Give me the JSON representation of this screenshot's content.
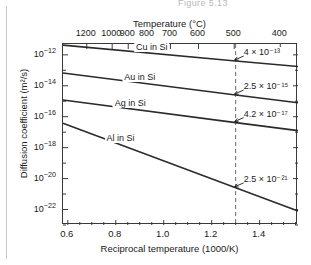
{
  "page": {
    "header_fragment": "Figure 5.13"
  },
  "chart_data": {
    "type": "line",
    "title": "",
    "xlabel": "Reciprocal temperature (1000/K)",
    "ylabel": "Diffusion coefficient (m²/s)",
    "top_axis_label": "Temperature (°C)",
    "xlim": [
      0.58,
      1.56
    ],
    "ylim_log10": [
      -23.0,
      -11.3
    ],
    "grid": false,
    "legend": "inline-labels",
    "xticks": [
      "0.6",
      "0.8",
      "1.0",
      "1.2",
      "1.4"
    ],
    "xtick_values": [
      0.6,
      0.8,
      1.0,
      1.2,
      1.4
    ],
    "yticks": [
      {
        "mantissa": "10",
        "exponent": "−12",
        "log10": -12
      },
      {
        "mantissa": "10",
        "exponent": "−14",
        "log10": -14
      },
      {
        "mantissa": "10",
        "exponent": "−16",
        "log10": -16
      },
      {
        "mantissa": "10",
        "exponent": "−18",
        "log10": -18
      },
      {
        "mantissa": "10",
        "exponent": "−20",
        "log10": -20
      },
      {
        "mantissa": "10",
        "exponent": "−22",
        "log10": -22
      }
    ],
    "top_ticks": [
      {
        "label": "1200",
        "celsius": 1200,
        "x": 0.679
      },
      {
        "label": "1000",
        "celsius": 1000,
        "x": 0.785
      },
      {
        "label": "900",
        "celsius": 900,
        "x": 0.852
      },
      {
        "label": "800",
        "celsius": 800,
        "x": 0.932
      },
      {
        "label": "700",
        "celsius": 700,
        "x": 1.028
      },
      {
        "label": "600",
        "celsius": 600,
        "x": 1.145
      },
      {
        "label": "500",
        "celsius": 500,
        "x": 1.294
      },
      {
        "label": "400",
        "celsius": 400,
        "x": 1.486
      }
    ],
    "marker_line": {
      "x": 1.3,
      "style": "dashed",
      "label": "500 °C reference"
    },
    "series": [
      {
        "name": "Cu in Si",
        "label": "Cu in Si",
        "points": [
          [
            0.58,
            -11.37
          ],
          [
            1.3,
            -12.4
          ],
          [
            1.56,
            -12.75
          ]
        ],
        "value_at_marker": "4 × 10⁻¹³"
      },
      {
        "name": "Au in Si",
        "label": "Au in Si",
        "points": [
          [
            0.58,
            -13.18
          ],
          [
            1.3,
            -14.6
          ],
          [
            1.56,
            -15.1
          ]
        ],
        "value_at_marker": "2.5 × 10⁻¹⁵"
      },
      {
        "name": "Ag in Si",
        "label": "Ag in Si",
        "points": [
          [
            0.58,
            -14.92
          ],
          [
            1.3,
            -16.38
          ],
          [
            1.56,
            -16.9
          ]
        ],
        "value_at_marker": "4.2 × 10⁻¹⁷"
      },
      {
        "name": "Al in Si",
        "label": "Al in Si",
        "points": [
          [
            0.58,
            -16.42
          ],
          [
            1.3,
            -20.6
          ],
          [
            1.56,
            -22.1
          ]
        ],
        "value_at_marker": "2.5 × 10⁻²¹"
      }
    ],
    "annotations": [
      {
        "text": "4 × 10⁻¹³",
        "series": "Cu in Si"
      },
      {
        "text": "2.5 × 10⁻¹⁵",
        "series": "Au in Si"
      },
      {
        "text": "4.2 × 10⁻¹⁷",
        "series": "Ag in Si"
      },
      {
        "text": "2.5 × 10⁻²¹",
        "series": "Al in Si"
      }
    ]
  },
  "colors": {
    "line": "#2b2b2b",
    "frame": "#3a3a3a",
    "dashed": "#6b6b6b",
    "text": "#1a1a1a",
    "background": "#ffffff"
  }
}
